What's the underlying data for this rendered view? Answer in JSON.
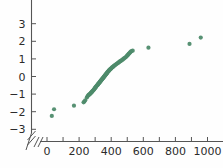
{
  "chart_data": {
    "type": "scatter",
    "title": "",
    "xlabel": "",
    "ylabel": "",
    "xlim": [
      -60,
      1070
    ],
    "ylim": [
      -3.45,
      3.45
    ],
    "grid": false,
    "legend": null,
    "axis_break": {
      "axis": "both",
      "symbol": "//",
      "position": "origin"
    },
    "marker": {
      "shape": "circle",
      "size": 4.2,
      "color": "#4e8b6b",
      "opacity": 0.95
    },
    "x_ticks": [
      0,
      100,
      200,
      300,
      400,
      500,
      600,
      700,
      800,
      900,
      1000
    ],
    "x_tick_labels": [
      "0",
      "",
      "200",
      "",
      "400",
      "",
      "600",
      "",
      "800",
      "",
      "1000"
    ],
    "y_ticks": [
      -3,
      -2,
      -1,
      0,
      1,
      2,
      3
    ],
    "y_tick_labels": [
      "−3",
      "−2",
      "−1",
      "0",
      "1",
      "2",
      "3"
    ],
    "points": [
      [
        30,
        -2.24
      ],
      [
        44,
        -1.86
      ],
      [
        168,
        -1.66
      ],
      [
        228,
        -1.47
      ],
      [
        233,
        -1.42
      ],
      [
        238,
        -1.35
      ],
      [
        248,
        -1.2
      ],
      [
        252,
        -1.14
      ],
      [
        256,
        -1.08
      ],
      [
        259,
        -1.05
      ],
      [
        262,
        -1.03
      ],
      [
        265,
        -1.01
      ],
      [
        268,
        -0.99
      ],
      [
        272,
        -0.95
      ],
      [
        275,
        -0.92
      ],
      [
        278,
        -0.89
      ],
      [
        281,
        -0.86
      ],
      [
        284,
        -0.83
      ],
      [
        287,
        -0.8
      ],
      [
        290,
        -0.77
      ],
      [
        292,
        -0.74
      ],
      [
        295,
        -0.71
      ],
      [
        297,
        -0.68
      ],
      [
        300,
        -0.65
      ],
      [
        302,
        -0.62
      ],
      [
        305,
        -0.59
      ],
      [
        307,
        -0.56
      ],
      [
        310,
        -0.53
      ],
      [
        312,
        -0.5
      ],
      [
        315,
        -0.48
      ],
      [
        317,
        -0.45
      ],
      [
        319,
        -0.43
      ],
      [
        321,
        -0.4
      ],
      [
        324,
        -0.38
      ],
      [
        326,
        -0.35
      ],
      [
        328,
        -0.33
      ],
      [
        330,
        -0.3
      ],
      [
        332,
        -0.28
      ],
      [
        334,
        -0.26
      ],
      [
        336,
        -0.24
      ],
      [
        338,
        -0.21
      ],
      [
        340,
        -0.19
      ],
      [
        342,
        -0.17
      ],
      [
        344,
        -0.14
      ],
      [
        346,
        -0.12
      ],
      [
        348,
        -0.1
      ],
      [
        350,
        -0.08
      ],
      [
        352,
        -0.05
      ],
      [
        354,
        -0.03
      ],
      [
        356,
        -0.01
      ],
      [
        358,
        0.02
      ],
      [
        360,
        0.04
      ],
      [
        362,
        0.06
      ],
      [
        364,
        0.09
      ],
      [
        366,
        0.11
      ],
      [
        368,
        0.13
      ],
      [
        370,
        0.16
      ],
      [
        372,
        0.18
      ],
      [
        374,
        0.2
      ],
      [
        376,
        0.23
      ],
      [
        378,
        0.25
      ],
      [
        381,
        0.28
      ],
      [
        383,
        0.3
      ],
      [
        385,
        0.33
      ],
      [
        388,
        0.35
      ],
      [
        390,
        0.38
      ],
      [
        393,
        0.4
      ],
      [
        396,
        0.43
      ],
      [
        399,
        0.45
      ],
      [
        402,
        0.48
      ],
      [
        405,
        0.51
      ],
      [
        408,
        0.53
      ],
      [
        412,
        0.56
      ],
      [
        416,
        0.59
      ],
      [
        420,
        0.62
      ],
      [
        424,
        0.65
      ],
      [
        428,
        0.68
      ],
      [
        433,
        0.71
      ],
      [
        437,
        0.74
      ],
      [
        442,
        0.77
      ],
      [
        447,
        0.8
      ],
      [
        452,
        0.84
      ],
      [
        457,
        0.87
      ],
      [
        462,
        0.9
      ],
      [
        468,
        0.94
      ],
      [
        473,
        0.97
      ],
      [
        478,
        1.01
      ],
      [
        483,
        1.05
      ],
      [
        488,
        1.08
      ],
      [
        493,
        1.12
      ],
      [
        497,
        1.16
      ],
      [
        501,
        1.2
      ],
      [
        505,
        1.24
      ],
      [
        509,
        1.28
      ],
      [
        513,
        1.32
      ],
      [
        517,
        1.36
      ],
      [
        521,
        1.4
      ],
      [
        526,
        1.44
      ],
      [
        534,
        1.47
      ],
      [
        632,
        1.64
      ],
      [
        888,
        1.85
      ],
      [
        958,
        2.21
      ]
    ]
  },
  "axes": {
    "x_axis_name": "x-axis",
    "y_axis_name": "y-axis",
    "break_marker_label": "//"
  }
}
